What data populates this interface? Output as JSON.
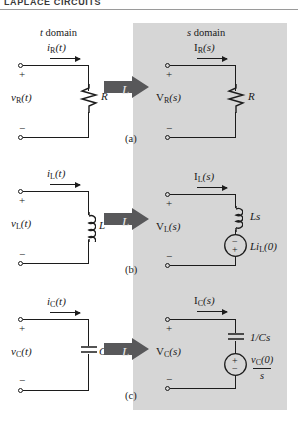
{
  "header": {
    "title": "LAPLACE  CIRCUITS"
  },
  "panel": {
    "fill": "#d6d6d6",
    "arrow_fill": "#58585a"
  },
  "columns": {
    "t_domain": {
      "label": "t domain",
      "italic_lead": "t"
    },
    "s_domain": {
      "label": "s domain",
      "italic_lead": "s"
    }
  },
  "transform_symbol": "L",
  "rows": [
    {
      "caption": "(a)",
      "element": "resistor",
      "t": {
        "current": {
          "base": "i",
          "sub": "R",
          "arg": "(t)"
        },
        "voltage": {
          "base": "v",
          "sub": "R",
          "arg": "(t)"
        },
        "component": "R",
        "plus": "+",
        "minus": "−"
      },
      "s": {
        "current": {
          "base": "I",
          "sub": "R",
          "arg": "(s)"
        },
        "voltage": {
          "base": "V",
          "sub": "R",
          "arg": "(s)"
        },
        "component": "R",
        "plus": "+",
        "minus": "−",
        "source": null
      }
    },
    {
      "caption": "(b)",
      "element": "inductor",
      "t": {
        "current": {
          "base": "i",
          "sub": "L",
          "arg": "(t)"
        },
        "voltage": {
          "base": "v",
          "sub": "L",
          "arg": "(t)"
        },
        "component": "L",
        "plus": "+",
        "minus": "−"
      },
      "s": {
        "current": {
          "base": "I",
          "sub": "L",
          "arg": "(s)"
        },
        "voltage": {
          "base": "V",
          "sub": "L",
          "arg": "(s)"
        },
        "component": "Ls",
        "plus": "+",
        "minus": "−",
        "source": {
          "label_base": "Li",
          "label_sub": "L",
          "label_arg": "(0)",
          "top_sign": "−",
          "bottom_sign": "+"
        }
      }
    },
    {
      "caption": "(c)",
      "element": "capacitor",
      "t": {
        "current": {
          "base": "i",
          "sub": "C",
          "arg": "(t)"
        },
        "voltage": {
          "base": "v",
          "sub": "C",
          "arg": "(t)"
        },
        "component": "C",
        "plus": "+",
        "minus": "−"
      },
      "s": {
        "current": {
          "base": "I",
          "sub": "C",
          "arg": "(s)"
        },
        "voltage": {
          "base": "V",
          "sub": "C",
          "arg": "(s)"
        },
        "component": "1/Cs",
        "plus": "+",
        "minus": "−",
        "source": {
          "numer_base": "v",
          "numer_sub": "C",
          "numer_arg": "(0)",
          "denom": "s",
          "top_sign": "+",
          "bottom_sign": "−"
        }
      }
    }
  ]
}
